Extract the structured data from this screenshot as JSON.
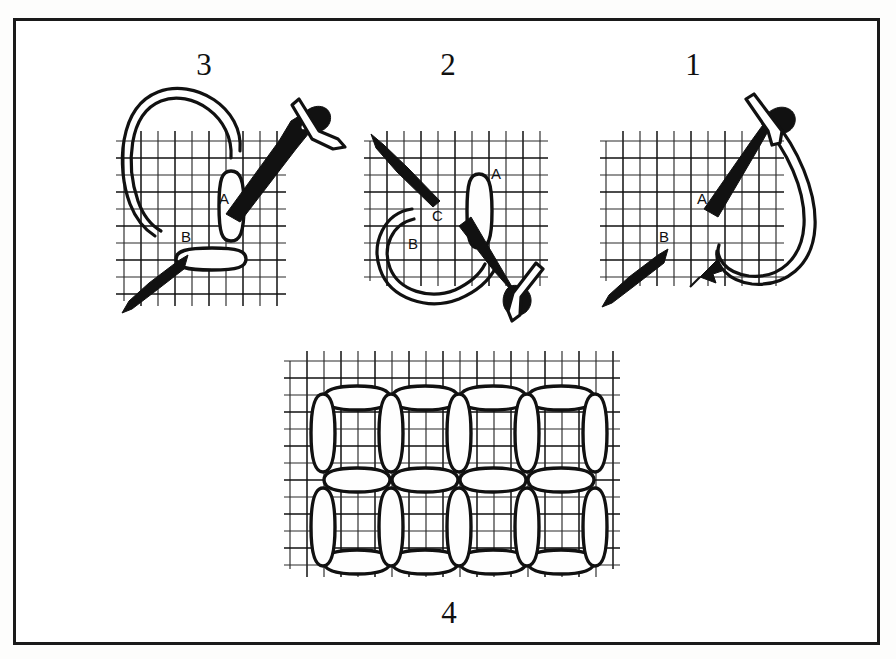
{
  "figure": {
    "border_color": "#1a1a1a",
    "background_color": "#ffffff",
    "ink_color": "#111111",
    "grid_color": "#2a2a2a"
  },
  "panels": [
    {
      "id": "panel-3",
      "number": "3",
      "number_x": 188,
      "number_y": 44,
      "grid": {
        "x": 120,
        "y": 138,
        "cols": 9,
        "rows": 9,
        "cell": 17
      },
      "labels": [
        {
          "text": "A",
          "x": 210,
          "y": 188
        },
        {
          "text": "B",
          "x": 173,
          "y": 225
        }
      ],
      "elements": [
        "needle-upper-right",
        "needle-lower-left",
        "thread-loop-large",
        "stitch-vertical",
        "stitch-horizontal"
      ]
    },
    {
      "id": "panel-2",
      "number": "2",
      "number_x": 432,
      "number_y": 44,
      "grid": {
        "x": 366,
        "y": 144,
        "cols": 10,
        "rows": 9,
        "cell": 17
      },
      "labels": [
        {
          "text": "A",
          "x": 481,
          "y": 162
        },
        {
          "text": "C",
          "x": 424,
          "y": 200
        },
        {
          "text": "B",
          "x": 399,
          "y": 228
        }
      ],
      "elements": [
        "needle-upper-left",
        "needle-lower-right",
        "thread-loop-round",
        "stitch-vertical"
      ]
    },
    {
      "id": "panel-1",
      "number": "1",
      "number_x": 677,
      "number_y": 44,
      "grid": {
        "x": 602,
        "y": 138,
        "cols": 10,
        "rows": 9,
        "cell": 17
      },
      "labels": [
        {
          "text": "A",
          "x": 688,
          "y": 183
        },
        {
          "text": "B",
          "x": 650,
          "y": 224
        }
      ],
      "elements": [
        "needle-upper-right",
        "needle-lower-left",
        "thread-loop-right",
        "direction-arrow"
      ]
    },
    {
      "id": "panel-4",
      "number": "4",
      "number_x": 433,
      "number_y": 592,
      "grid": {
        "x": 287,
        "y": 349,
        "cols": 19,
        "rows": 13,
        "cell": 17
      },
      "labels": [],
      "pattern": {
        "columns": 4,
        "rows": 2,
        "block_width": 68,
        "block_height": 85,
        "origin_x": 321,
        "origin_y": 383,
        "description": "completed square boss stitch blocks formed from paired vertical and horizontal oval stitches"
      }
    }
  ]
}
